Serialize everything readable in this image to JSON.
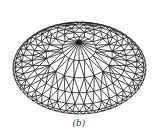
{
  "figure": {
    "caption": "(b)",
    "stroke_color": "#1a1a1a",
    "background": "#ffffff"
  },
  "dome": {
    "center_x": 79.5,
    "center_y": 68,
    "radius_x": 66.5,
    "radius_y": 46,
    "apex_x": 79,
    "apex_y": 42,
    "rings": 6,
    "spokes": 20
  }
}
